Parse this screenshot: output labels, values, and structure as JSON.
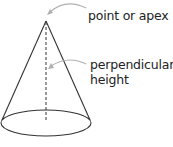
{
  "diagram": {
    "shape": "cone",
    "labels": {
      "apex": "point or apex",
      "height_line1": "perpendicular",
      "height_line2": "height"
    },
    "colors": {
      "stroke": "#333333",
      "arrow": "#b0b0b0",
      "text": "#222222"
    }
  }
}
